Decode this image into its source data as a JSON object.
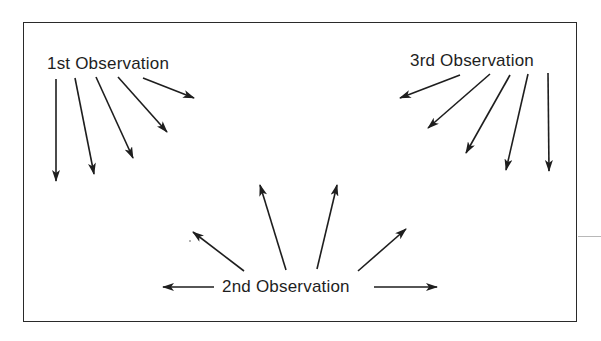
{
  "diagram": {
    "colors": {
      "background": "#ffffff",
      "ink": "#1e1e1e",
      "frame": "#2a2a2a"
    },
    "groups": [
      {
        "id": "first",
        "label": "1st Observation",
        "label_pos": {
          "x": 47,
          "y": 55
        },
        "arrows": [
          {
            "x1": 56,
            "y1": 79,
            "x2": 56,
            "y2": 181
          },
          {
            "x1": 75,
            "y1": 78,
            "x2": 94,
            "y2": 174
          },
          {
            "x1": 96,
            "y1": 77,
            "x2": 133,
            "y2": 158
          },
          {
            "x1": 118,
            "y1": 77,
            "x2": 167,
            "y2": 132
          },
          {
            "x1": 143,
            "y1": 78,
            "x2": 194,
            "y2": 98
          }
        ]
      },
      {
        "id": "second",
        "label": "2nd Observation",
        "label_pos": {
          "x": 222,
          "y": 278
        },
        "arrows": [
          {
            "x1": 214,
            "y1": 287,
            "x2": 163,
            "y2": 287
          },
          {
            "x1": 374,
            "y1": 287,
            "x2": 437,
            "y2": 287
          },
          {
            "x1": 244,
            "y1": 271,
            "x2": 193,
            "y2": 232
          },
          {
            "x1": 286,
            "y1": 270,
            "x2": 260,
            "y2": 185
          },
          {
            "x1": 317,
            "y1": 269,
            "x2": 337,
            "y2": 185
          },
          {
            "x1": 358,
            "y1": 271,
            "x2": 406,
            "y2": 229
          }
        ]
      },
      {
        "id": "third",
        "label": "3rd Observation",
        "label_pos": {
          "x": 410,
          "y": 52
        },
        "arrows": [
          {
            "x1": 460,
            "y1": 75,
            "x2": 400,
            "y2": 98
          },
          {
            "x1": 490,
            "y1": 74,
            "x2": 428,
            "y2": 128
          },
          {
            "x1": 510,
            "y1": 75,
            "x2": 466,
            "y2": 153
          },
          {
            "x1": 528,
            "y1": 74,
            "x2": 506,
            "y2": 170
          },
          {
            "x1": 548,
            "y1": 73,
            "x2": 549,
            "y2": 171
          }
        ]
      }
    ]
  }
}
